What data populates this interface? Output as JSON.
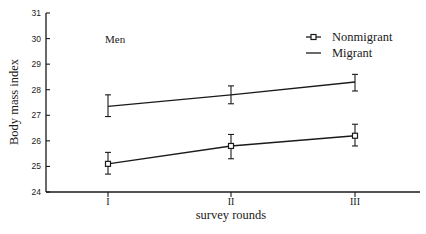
{
  "chart_data": {
    "type": "line",
    "title": "",
    "panel_label": "Men",
    "xlabel": "survey rounds",
    "ylabel": "Body mass index",
    "categories": [
      "I",
      "II",
      "III"
    ],
    "ylim": [
      24,
      31
    ],
    "yticks": [
      24,
      25,
      26,
      27,
      28,
      29,
      30,
      31
    ],
    "grid": false,
    "legend_position": "upper right",
    "series": [
      {
        "name": "Nonmigrant",
        "marker": "square",
        "values": [
          25.1,
          25.8,
          26.2
        ],
        "error_low": [
          24.7,
          25.3,
          25.8
        ],
        "error_high": [
          25.55,
          26.25,
          26.65
        ]
      },
      {
        "name": "Migrant",
        "marker": "none",
        "values": [
          27.35,
          27.8,
          28.3
        ],
        "error_low": [
          26.95,
          27.45,
          27.95
        ],
        "error_high": [
          27.8,
          28.15,
          28.6
        ]
      }
    ]
  },
  "colors": {
    "ink": "#1a1a1a",
    "background": "#ffffff"
  }
}
